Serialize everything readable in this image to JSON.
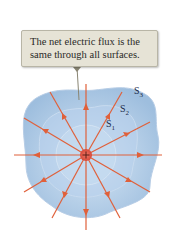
{
  "callout": {
    "line1": "The net electric flux is the",
    "line2": "same through all surfaces."
  },
  "labels": {
    "s1": {
      "base": "S",
      "sub": "1"
    },
    "s2": {
      "base": "S",
      "sub": "2"
    },
    "s3": {
      "base": "S",
      "sub": "3"
    }
  },
  "charge": {
    "symbol": "+",
    "color": "#e04a3a"
  },
  "colors": {
    "field_lines": "#e0603a",
    "surface_fill": "#a9c6e4",
    "callout_bg": "#e6e3d6"
  }
}
